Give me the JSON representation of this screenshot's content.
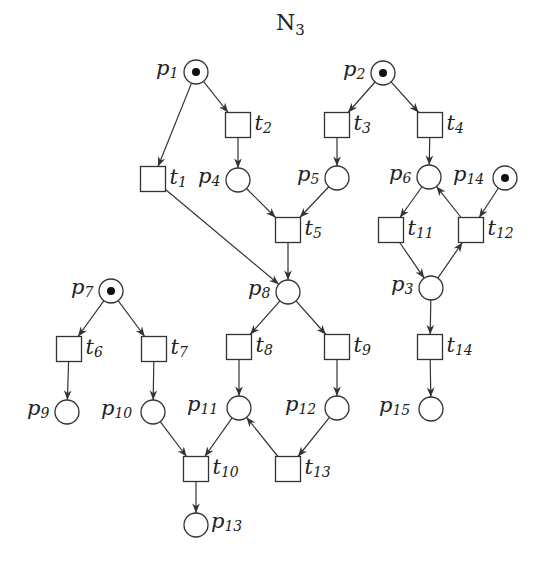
{
  "title": {
    "base": "N",
    "sub": "3"
  },
  "colors": {
    "stroke": "#333333",
    "token": "#111111",
    "background": "#ffffff"
  },
  "places": [
    {
      "id": "p1",
      "name": "p",
      "sub": "1",
      "x": 196,
      "y": 72,
      "tokens": 1,
      "label_side": "left"
    },
    {
      "id": "p2",
      "name": "p",
      "sub": "2",
      "x": 383,
      "y": 73,
      "tokens": 1,
      "label_side": "left"
    },
    {
      "id": "p3",
      "name": "p",
      "sub": "3",
      "x": 431,
      "y": 288,
      "tokens": 0,
      "label_side": "left"
    },
    {
      "id": "p4",
      "name": "p",
      "sub": "4",
      "x": 238,
      "y": 180,
      "tokens": 0,
      "label_side": "left"
    },
    {
      "id": "p5",
      "name": "p",
      "sub": "5",
      "x": 337,
      "y": 178,
      "tokens": 0,
      "label_side": "left"
    },
    {
      "id": "p6",
      "name": "p",
      "sub": "6",
      "x": 429,
      "y": 177,
      "tokens": 0,
      "label_side": "left"
    },
    {
      "id": "p7",
      "name": "p",
      "sub": "7",
      "x": 111,
      "y": 291,
      "tokens": 1,
      "label_side": "left"
    },
    {
      "id": "p8",
      "name": "p",
      "sub": "8",
      "x": 288,
      "y": 292,
      "tokens": 0,
      "label_side": "left"
    },
    {
      "id": "p9",
      "name": "p",
      "sub": "9",
      "x": 67,
      "y": 412,
      "tokens": 0,
      "label_side": "left"
    },
    {
      "id": "p10",
      "name": "p",
      "sub": "10",
      "x": 153,
      "y": 412,
      "tokens": 0,
      "label_side": "left"
    },
    {
      "id": "p11",
      "name": "p",
      "sub": "11",
      "x": 239,
      "y": 408,
      "tokens": 0,
      "label_side": "left"
    },
    {
      "id": "p12",
      "name": "p",
      "sub": "12",
      "x": 337,
      "y": 408,
      "tokens": 0,
      "label_side": "left"
    },
    {
      "id": "p13",
      "name": "p",
      "sub": "13",
      "x": 196,
      "y": 525,
      "tokens": 0,
      "label_side": "right"
    },
    {
      "id": "p14",
      "name": "p",
      "sub": "14",
      "x": 505,
      "y": 178,
      "tokens": 1,
      "label_side": "left"
    },
    {
      "id": "p15",
      "name": "p",
      "sub": "15",
      "x": 431,
      "y": 409,
      "tokens": 0,
      "label_side": "left"
    }
  ],
  "transitions": [
    {
      "id": "t1",
      "name": "t",
      "sub": "1",
      "x": 153,
      "y": 179
    },
    {
      "id": "t2",
      "name": "t",
      "sub": "2",
      "x": 238,
      "y": 125
    },
    {
      "id": "t3",
      "name": "t",
      "sub": "3",
      "x": 337,
      "y": 125
    },
    {
      "id": "t4",
      "name": "t",
      "sub": "4",
      "x": 430,
      "y": 125
    },
    {
      "id": "t5",
      "name": "t",
      "sub": "5",
      "x": 288,
      "y": 230
    },
    {
      "id": "t6",
      "name": "t",
      "sub": "6",
      "x": 69,
      "y": 349
    },
    {
      "id": "t7",
      "name": "t",
      "sub": "7",
      "x": 154,
      "y": 349
    },
    {
      "id": "t8",
      "name": "t",
      "sub": "8",
      "x": 239,
      "y": 347
    },
    {
      "id": "t9",
      "name": "t",
      "sub": "9",
      "x": 337,
      "y": 347
    },
    {
      "id": "t10",
      "name": "t",
      "sub": "10",
      "x": 196,
      "y": 469
    },
    {
      "id": "t11",
      "name": "t",
      "sub": "11",
      "x": 391,
      "y": 230
    },
    {
      "id": "t12",
      "name": "t",
      "sub": "12",
      "x": 471,
      "y": 230
    },
    {
      "id": "t13",
      "name": "t",
      "sub": "13",
      "x": 288,
      "y": 469
    },
    {
      "id": "t14",
      "name": "t",
      "sub": "14",
      "x": 430,
      "y": 347
    }
  ],
  "arcs": [
    [
      "p1",
      "t1"
    ],
    [
      "p1",
      "t2"
    ],
    [
      "t2",
      "p4"
    ],
    [
      "t1",
      "p8"
    ],
    [
      "p2",
      "t3"
    ],
    [
      "p2",
      "t4"
    ],
    [
      "t3",
      "p5"
    ],
    [
      "t4",
      "p6"
    ],
    [
      "p4",
      "t5"
    ],
    [
      "p5",
      "t5"
    ],
    [
      "t5",
      "p8"
    ],
    [
      "p6",
      "t11"
    ],
    [
      "t11",
      "p3"
    ],
    [
      "p3",
      "t12"
    ],
    [
      "t12",
      "p6"
    ],
    [
      "p14",
      "t12"
    ],
    [
      "p3",
      "t14"
    ],
    [
      "t14",
      "p15"
    ],
    [
      "p7",
      "t6"
    ],
    [
      "p7",
      "t7"
    ],
    [
      "t6",
      "p9"
    ],
    [
      "t7",
      "p10"
    ],
    [
      "p8",
      "t8"
    ],
    [
      "p8",
      "t9"
    ],
    [
      "t8",
      "p11"
    ],
    [
      "t9",
      "p12"
    ],
    [
      "p10",
      "t10"
    ],
    [
      "p11",
      "t10"
    ],
    [
      "t10",
      "p13"
    ],
    [
      "p12",
      "t13"
    ],
    [
      "t13",
      "p11"
    ]
  ],
  "geometry": {
    "place_radius": 12,
    "transition_size": 25,
    "token_radius": 4
  }
}
